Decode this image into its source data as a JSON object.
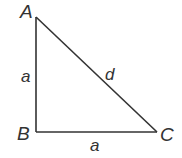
{
  "diagram": {
    "type": "right-triangle",
    "vertices": [
      {
        "id": "A",
        "label": "A"
      },
      {
        "id": "B",
        "label": "B"
      },
      {
        "id": "C",
        "label": "C"
      }
    ],
    "edges": [
      {
        "from": "A",
        "to": "B",
        "label": "a"
      },
      {
        "from": "B",
        "to": "C",
        "label": "a"
      },
      {
        "from": "A",
        "to": "C",
        "label": "d"
      }
    ],
    "right_angle_at": "B",
    "colors": {
      "stroke": "#333333",
      "text": "#333333",
      "background": "#ffffff"
    }
  }
}
